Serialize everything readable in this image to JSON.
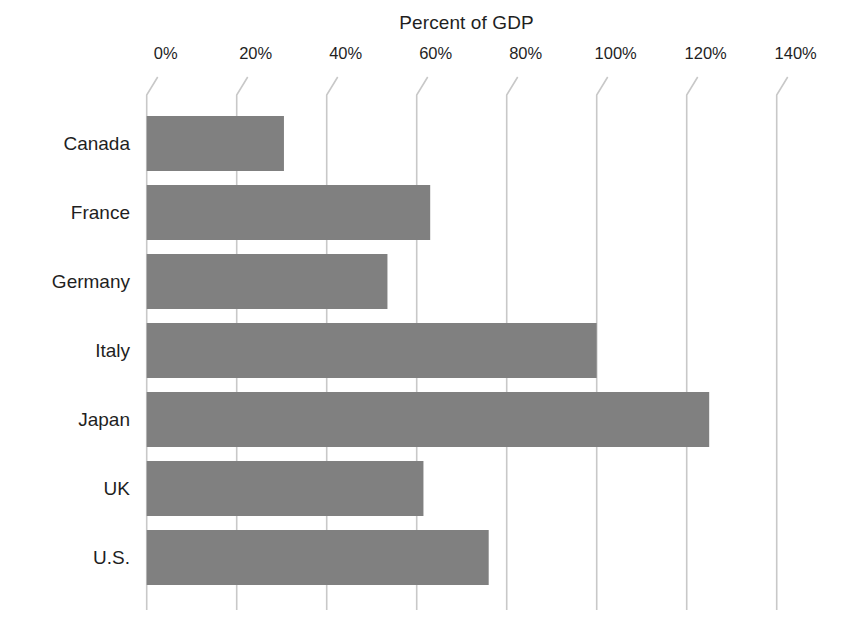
{
  "chart_data": {
    "type": "bar",
    "orientation": "horizontal",
    "title": "Percent of GDP",
    "xlabel": "",
    "ylabel": "",
    "categories": [
      "Canada",
      "France",
      "Germany",
      "Italy",
      "Japan",
      "UK",
      "U.S."
    ],
    "values": [
      30.5,
      63,
      53.5,
      100,
      125,
      61.5,
      76
    ],
    "xlim": [
      0,
      140
    ],
    "xticks": [
      0,
      20,
      40,
      60,
      80,
      100,
      120,
      140
    ],
    "xtick_labels": [
      "0%",
      "20%",
      "40%",
      "60%",
      "80%",
      "100%",
      "120%",
      "140%"
    ],
    "grid": true,
    "legend": false,
    "bar_color": "#808080",
    "grid_color": "#c8c8c8",
    "text_color": "#1f1f1f",
    "background": "#ffffff"
  },
  "axis": {
    "x_px_at_zero": 146.7,
    "x_px_per_unit": 4.5,
    "plot_top": 95,
    "plot_bottom": 610,
    "bar_height": 55,
    "bar_pitch": 69,
    "first_bar_top": 116,
    "hook_dx": 11,
    "hook_dy": 18
  }
}
